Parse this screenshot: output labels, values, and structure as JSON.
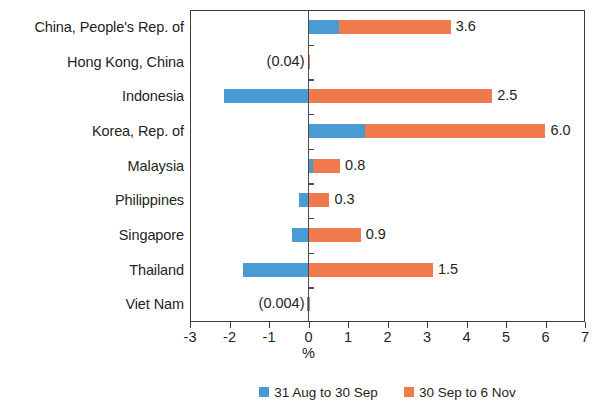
{
  "chart_data": {
    "type": "bar",
    "orientation": "horizontal",
    "stacked": true,
    "title": "",
    "xlabel": "%",
    "ylabel": "",
    "xlim": [
      -3,
      7
    ],
    "xticks": [
      -3,
      -2,
      -1,
      0,
      1,
      2,
      3,
      4,
      5,
      6,
      7
    ],
    "xtick_labels": [
      "-3",
      "-2",
      "-1",
      "0",
      "1",
      "2",
      "3",
      "4",
      "5",
      "6",
      "7"
    ],
    "grid": false,
    "legend_position": "bottom",
    "categories": [
      "China, People's Rep. of",
      "Hong Kong, China",
      "Indonesia",
      "Korea, Rep. of",
      "Malaysia",
      "Philippines",
      "Singapore",
      "Thailand",
      "Viet Nam"
    ],
    "series": [
      {
        "name": "31 Aug to 30 Sep",
        "color": "#4A9BD4",
        "values": [
          0.78,
          0.0,
          -2.15,
          1.42,
          0.12,
          -0.23,
          -0.42,
          -1.65,
          -0.05
        ]
      },
      {
        "name": "30 Sep to 6 Nov",
        "color": "#F07A4C",
        "values": [
          2.82,
          0.04,
          4.65,
          4.58,
          0.68,
          0.53,
          1.32,
          3.15,
          0.04
        ]
      }
    ],
    "total_labels": [
      "3.6",
      "(0.04)",
      "2.5",
      "6.0",
      "0.8",
      "0.3",
      "0.9",
      "1.5",
      "(0.004)"
    ],
    "total_label_side": [
      "right",
      "left",
      "right",
      "right",
      "right",
      "right",
      "right",
      "right",
      "left"
    ],
    "totals": [
      3.6,
      -0.04,
      2.5,
      6.0,
      0.8,
      0.3,
      0.9,
      1.5,
      -0.004
    ]
  },
  "legend": {
    "items": [
      {
        "label": "31 Aug to 30 Sep",
        "color": "#4A9BD4"
      },
      {
        "label": "30 Sep to 6 Nov",
        "color": "#F07A4C"
      }
    ]
  },
  "axis": {
    "x_title": "%"
  }
}
